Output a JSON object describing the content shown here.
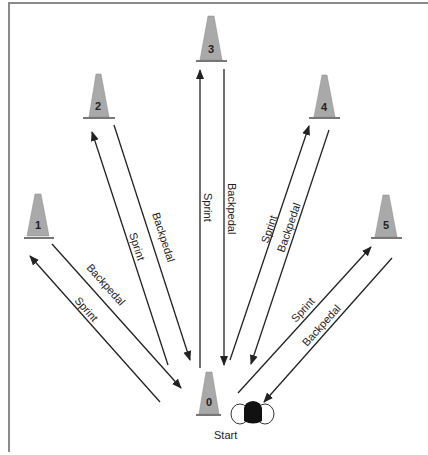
{
  "diagram": {
    "type": "cone-drill",
    "start_label": "Start",
    "colors": {
      "cone_fill": "#a9a9a9",
      "cone_stroke": "#777777",
      "line": "#222222",
      "frame": "#8a8a8a",
      "runner": "#111111"
    },
    "cones": [
      {
        "id": "0",
        "label": "0"
      },
      {
        "id": "1",
        "label": "1"
      },
      {
        "id": "2",
        "label": "2"
      },
      {
        "id": "3",
        "label": "3"
      },
      {
        "id": "4",
        "label": "4"
      },
      {
        "id": "5",
        "label": "5"
      }
    ],
    "paths": [
      {
        "to_cone": "1",
        "sprint": "Sprint",
        "backpedal": "Backpedal"
      },
      {
        "to_cone": "2",
        "sprint": "Sprint",
        "backpedal": "Backpedal"
      },
      {
        "to_cone": "3",
        "sprint": "Sprint",
        "backpedal": "Backpedal"
      },
      {
        "to_cone": "4",
        "sprint": "Sprint",
        "backpedal": "Backpedal"
      },
      {
        "to_cone": "5",
        "sprint": "Sprint",
        "backpedal": "Backpedal"
      }
    ]
  }
}
